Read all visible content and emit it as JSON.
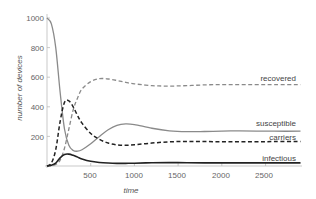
{
  "chart_data": {
    "type": "line",
    "title": "",
    "xlabel": "time",
    "ylabel": "number of devices",
    "xlim": [
      0,
      2900
    ],
    "ylim": [
      0,
      1000
    ],
    "x_ticks": [
      500,
      1000,
      1500,
      2000,
      2500
    ],
    "y_ticks": [
      200,
      400,
      600,
      800,
      1000
    ],
    "grid": false,
    "legend": "inline labels at right end of each curve",
    "x": [
      0,
      50,
      100,
      150,
      200,
      250,
      300,
      350,
      400,
      500,
      600,
      700,
      800,
      900,
      1000,
      1200,
      1400,
      1600,
      1800,
      2000,
      2200,
      2400,
      2600,
      2900
    ],
    "series": [
      {
        "name": "susceptible",
        "style": "solid",
        "color": "#888888",
        "values": [
          1000,
          960,
          800,
          500,
          250,
          140,
          105,
          100,
          110,
          150,
          200,
          245,
          275,
          285,
          280,
          255,
          238,
          232,
          233,
          236,
          237,
          236,
          235,
          235
        ]
      },
      {
        "name": "recovered",
        "style": "dashed",
        "color": "#888888",
        "values": [
          0,
          2,
          10,
          40,
          120,
          250,
          380,
          460,
          520,
          570,
          590,
          588,
          578,
          565,
          555,
          543,
          540,
          543,
          548,
          550,
          550,
          550,
          550,
          550
        ]
      },
      {
        "name": "carriers",
        "style": "dashed",
        "color": "#222222",
        "values": [
          0,
          20,
          110,
          300,
          430,
          440,
          400,
          340,
          290,
          220,
          180,
          155,
          143,
          140,
          143,
          155,
          163,
          166,
          165,
          164,
          164,
          164,
          165,
          165
        ]
      },
      {
        "name": "infectious",
        "style": "solid",
        "color": "#222222",
        "values": [
          0,
          5,
          20,
          55,
          78,
          80,
          72,
          60,
          48,
          32,
          24,
          20,
          18,
          18,
          19,
          22,
          23,
          22,
          21,
          21,
          21,
          21,
          21,
          21
        ]
      }
    ]
  },
  "labels": {
    "xlabel": "time",
    "ylabel": "number of devices",
    "recovered": "recovered",
    "susceptible": "susceptible",
    "carriers": "carriers",
    "infectious": "infectious",
    "xt0": "500",
    "xt1": "1000",
    "xt2": "1500",
    "xt3": "2000",
    "xt4": "2500",
    "yt0": "200",
    "yt1": "400",
    "yt2": "600",
    "yt3": "800",
    "yt4": "1000"
  }
}
